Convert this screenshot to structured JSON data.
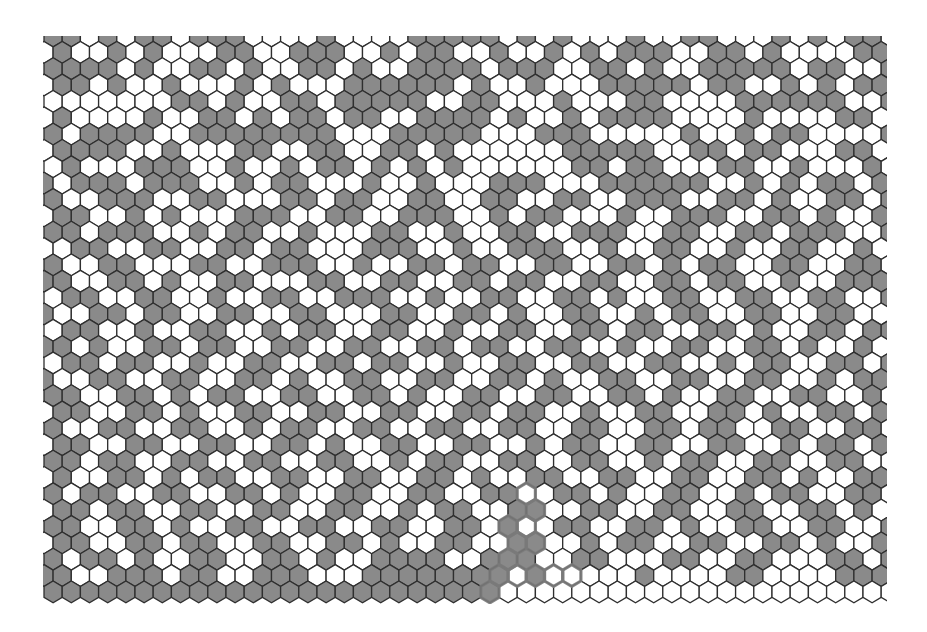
{
  "board": {
    "type": "hex-grid",
    "orientation": "pointy-top",
    "clip": {
      "x": 43,
      "y": 36,
      "width": 844,
      "height": 568
    },
    "origin": {
      "even_row_first_center_x": 53.1,
      "odd_row_first_center_x": 44.0,
      "first_row_center_y": 36
    },
    "cell_width": 18.2,
    "row_pitch": 16.35,
    "rows": 35,
    "cols": 47,
    "colors": {
      "filled": "#8a8a8a",
      "empty": "#ffffff",
      "stroke": "#2f2f2f",
      "highlight": "#7a7a7a"
    },
    "cells": [
      "GGWGWGGWGGGWWWWGWWWWGGGGGWGWGWWWGWWGGWWWGWGWGGW",
      "WGWWGWGWWWGGWWGGGWWGWGGWWGWWGWGWGGGWWGGWGWWWWGG",
      "GGGGWGWWGGWGWWGGWGWWGGGGWGGGWWGGWGWWGGGGGWGGWWG",
      "WGGWGWWGWWWGWGWWWGGGGGGWGWWGWWWGGGGGWGGWWGWGWGG",
      "WWWWWWWGGWGWWGGWGGGGGWWGGWWWGWWWGGWWWWGGGGGGWWG",
      "WGWWWWGWWGGWGWGGWGGWWGGGGWGWWGWGGGGWWWWGWWWWGGW",
      "GWGGGGWWGGGGGGGGWWWGGGGGWWWGGGWWWWWGWWGWGGWWWWG",
      "WGGGGWWGWWWGGWWGGWWGGWGWWWWWWGGGGGWWGGWGGWWWGGW",
      "WGWWWGGGWWGWWGWGGWGWGWGWWWWWWGGWGGWWWGGWWGWWWGW",
      "GWGGGWGGGWWGWGGWWWGWWGWWWGGGWWWGGGGGGWWGWGWGGWG",
      "GWWGGGWWGGWWWGGWGGWWGGWWGGWWGGWWGGGWWGGWGWWGGWG",
      "WGGWWGWGWWWGGGWWGGWWGGGWWGWGGWWWGWWGGGWWGGWGWWG",
      "GGWGGGWWGWGGWWGWWWGGWWGWWGGWWGGGWWGGWWGGWGGGWWG",
      "WWGGWWGGWWGGWGGWWWGGGWWGWWGGGWWGWWGGWWGWWGGWWGW",
      "GWWGGWWWGGWWGGGWWGWWGGWGGWWGGWWGGWGWGGWWGGWWGGW",
      "GGWWGGWGWWGGWWWGGWWGGWWGGWGGWWGGWWGGWGGWWGWWGGG",
      "WGGWWGGWWGWWGGWWGGGWWGWWGGWWGGWGWWGGWWGGWWGGWWG",
      "GWWGGWGGWWGGWWGGWWWGGWWGGWGWWGGWWGWGGWWGGWWGGWW",
      "WGGWWGWWGGWWGWGGWWGGWWGWWGGWWGGWGGWWGGWGWWGGWGG",
      "GGWGWWGGWGGWWGGWWGGWWGGWGGWWGGWWGWWGGWWGGWGWWGW",
      "WGGWGGWWGWWGGWWGGWGGWWGWWGGWWGGWWGGWWGWGGWWGGWG",
      "GWWGGWWGGWWGGWGWWGGWWGGWWGGWGWWGGWWGGWWGGWWGWGG",
      "GGWWGGWGWGGWWGGWWGGWGWWGGWWGGWWGGWGWWGGWWGGWWGW",
      "WGGWWGGWGWWGGWWGGWWGGWWGGWGGWWGWWGGWWGGWGWWGGWG",
      "GWWGGWWGGWWGWGGWWGGWWGGWWGGWWGGWWGGWGGWWGGWWGGW",
      "WGGWWGGWWGGWWGGWGWWGGWWGGWWGWGGWWGGWWGGWWGWGGWG",
      "GGWGGWWGGWWGGWWGGWWGWGGWWGGWWGGWWGWGGWWGGWWGGWW",
      "WGWWGGWGWGGWWGGWWGGWWGGWGWWGGWWGGWWGGWWGGWGWWGG",
      "GWGGWWGGWWGGWGWWGGWWGGWWGGWWGGWGWWGGWWGWGGWWGGW",
      "WGGWGGWWGGWWGGWWGGWWGWGGWWGGWWGGWWGGWWGGWWGGWGW",
      "GGWWGGWGWWGGWWGGWWGGWWGGWGWWGGWWGGWGWWGGWWGGWWG",
      "WGGWWGGWGGWWGGWWGGWGWWGGWWGGWWGWGGWWGGWWGGWGWWG",
      "GWGGWGWWGGWWGGWGWWGGGGWWGGGWWGGWWWGGWWGGWWWGGWG",
      "GGWWGGGWGGWWGGGWWWGGGGGGGGWGWWWWWGWWWWGGWWWWGGG",
      "GGGGGGGGGGGGGGGGGGGGGGGGGWWWWWWWWWWWWWWWWWWWWWW"
    ],
    "highlight_path": [
      {
        "row": 28,
        "col": 26
      },
      {
        "row": 29,
        "col": 27
      },
      {
        "row": 30,
        "col": 25
      },
      {
        "row": 30,
        "col": 26
      },
      {
        "row": 31,
        "col": 26
      },
      {
        "row": 31,
        "col": 27
      },
      {
        "row": 32,
        "col": 25
      },
      {
        "row": 33,
        "col": 25
      },
      {
        "row": 33,
        "col": 26
      },
      {
        "row": 33,
        "col": 27
      },
      {
        "row": 33,
        "col": 28
      },
      {
        "row": 33,
        "col": 29
      },
      {
        "row": 34,
        "col": 24
      }
    ]
  }
}
